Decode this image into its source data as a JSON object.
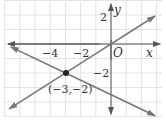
{
  "chart_data": {
    "type": "line",
    "title": "",
    "xlabel": "x",
    "ylabel": "y",
    "origin_label": "O",
    "xlim": [
      -7,
      3
    ],
    "ylim": [
      -4.5,
      3
    ],
    "grid": true,
    "x_tick_labels": [
      {
        "value": -4,
        "label": "−4"
      },
      {
        "value": -2,
        "label": "−2"
      }
    ],
    "y_tick_labels": [
      {
        "value": 2,
        "label": "2"
      },
      {
        "value": -2,
        "label": "−2"
      }
    ],
    "series": [
      {
        "name": "line-1",
        "equation": "y = (2/3)x",
        "points": [
          [
            -6.7,
            -4.47
          ],
          [
            2.9,
            1.93
          ]
        ]
      },
      {
        "name": "line-2",
        "equation": "y = -(1/2)x - 7/2",
        "points": [
          [
            -6.6,
            -0.2
          ],
          [
            2.9,
            -4.95
          ]
        ]
      }
    ],
    "annotations": [
      {
        "point": [
          -3,
          -2
        ],
        "label": "(−3,−2)",
        "marker": "filled-circle"
      }
    ]
  },
  "colors": {
    "grid": "#e2e2e2",
    "axis": "#555555",
    "line": "#777777",
    "point": "#222222"
  }
}
